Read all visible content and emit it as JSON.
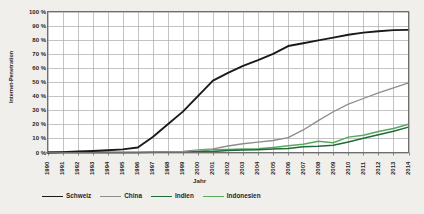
{
  "chart_data": {
    "type": "line",
    "title": "",
    "xlabel": "Jahr",
    "ylabel": "Internet-Penetration",
    "grid": true,
    "legend_position": "bottom",
    "xlim": [
      1990,
      2014
    ],
    "ylim": [
      0,
      100
    ],
    "ytick_suffix": " %",
    "categories": [
      "1990",
      "1991",
      "1992",
      "1993",
      "1994",
      "1995",
      "1996",
      "1997",
      "1998",
      "1999",
      "2000",
      "2001",
      "2002",
      "2003",
      "2004",
      "2005",
      "2006",
      "2007",
      "2008",
      "2009",
      "2010",
      "2011",
      "2012",
      "2013",
      "2014"
    ],
    "ytick_labels": [
      "0 %",
      "10 %",
      "20 %",
      "30 %",
      "40 %",
      "50 %",
      "60 %",
      "70 %",
      "80 %",
      "90 %",
      "100 %"
    ],
    "ytick_values": [
      0,
      10,
      20,
      30,
      40,
      50,
      60,
      70,
      80,
      90,
      100
    ],
    "series": [
      {
        "name": "Schweiz",
        "color": "#1a1a1a",
        "width": 1.9,
        "values": [
          0,
          0.3,
          0.7,
          1.1,
          1.6,
          2.2,
          3.5,
          11.0,
          20.0,
          29.0,
          40.0,
          51.0,
          56.5,
          61.5,
          65.5,
          70.0,
          75.5,
          77.5,
          79.5,
          81.5,
          83.5,
          85.0,
          86.0,
          86.8,
          87.0
        ]
      },
      {
        "name": "China",
        "color": "#8d8d8d",
        "width": 1.3,
        "values": [
          0,
          0,
          0,
          0,
          0,
          0,
          0.1,
          0.2,
          0.4,
          0.7,
          1.8,
          2.6,
          4.6,
          6.2,
          7.3,
          8.5,
          10.5,
          16.0,
          22.6,
          28.9,
          34.3,
          38.3,
          42.3,
          45.8,
          49.3
        ]
      },
      {
        "name": "Indien",
        "color": "#1f6b3a",
        "width": 1.5,
        "values": [
          0,
          0,
          0,
          0,
          0,
          0,
          0.05,
          0.1,
          0.2,
          0.3,
          0.5,
          0.7,
          1.5,
          1.7,
          2.0,
          2.4,
          2.8,
          4.0,
          4.4,
          5.1,
          7.5,
          10.1,
          12.6,
          15.1,
          18.0
        ]
      },
      {
        "name": "Indonesien",
        "color": "#58a85e",
        "width": 1.5,
        "values": [
          0,
          0,
          0,
          0,
          0,
          0,
          0.05,
          0.25,
          0.4,
          0.5,
          0.9,
          2.0,
          2.1,
          2.4,
          2.6,
          3.6,
          4.8,
          5.8,
          7.9,
          6.9,
          10.9,
          12.3,
          14.9,
          17.0,
          20.0
        ]
      }
    ]
  },
  "legend": {
    "items": [
      {
        "label": "Schweiz",
        "color": "#1a1a1a"
      },
      {
        "label": "China",
        "color": "#8d8d8d"
      },
      {
        "label": "Indien",
        "color": "#1f6b3a"
      },
      {
        "label": "Indonesien",
        "color": "#58a85e"
      }
    ]
  },
  "axis": {
    "y_title": "Internet-Penetration",
    "x_title": "Jahr"
  }
}
